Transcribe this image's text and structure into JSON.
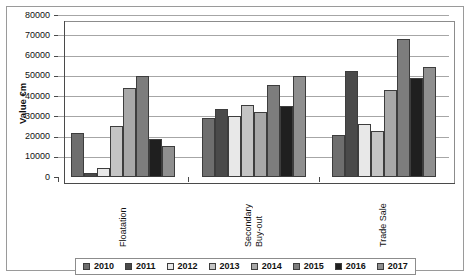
{
  "top_sliver_text": "",
  "chart_data": {
    "type": "bar",
    "title": "",
    "xlabel": "",
    "ylabel": "Value €m",
    "ylim": [
      0,
      80000
    ],
    "ytick_step": 10000,
    "yticks": [
      "0",
      "10000",
      "20000",
      "30000",
      "40000",
      "50000",
      "60000",
      "70000",
      "80000"
    ],
    "grid": true,
    "legend_position": "bottom",
    "categories": [
      "Floatation",
      "Secondary Buy-out",
      "Trade Sale"
    ],
    "category_label_lines": [
      [
        "Floatation"
      ],
      [
        "Secondary",
        "Buy-out"
      ],
      [
        "Trade Sale"
      ]
    ],
    "series": [
      {
        "name": "2010",
        "color": "#6e6e6e",
        "values": [
          21500,
          29000,
          20500
        ]
      },
      {
        "name": "2011",
        "color": "#4a4a4a",
        "values": [
          2000,
          33500,
          52500
        ]
      },
      {
        "name": "2012",
        "color": "#e8e8e8",
        "values": [
          4500,
          30000,
          26000
        ]
      },
      {
        "name": "2013",
        "color": "#c4c4c4",
        "values": [
          25000,
          35500,
          22500
        ]
      },
      {
        "name": "2014",
        "color": "#a8a8a8",
        "values": [
          44000,
          32000,
          43000
        ]
      },
      {
        "name": "2015",
        "color": "#7d7d7d",
        "values": [
          50000,
          45500,
          68000
        ]
      },
      {
        "name": "2016",
        "color": "#1f1f1f",
        "values": [
          19000,
          35000,
          49000
        ]
      },
      {
        "name": "2017",
        "color": "#8f8f8f",
        "values": [
          15500,
          50000,
          54500
        ]
      }
    ]
  }
}
